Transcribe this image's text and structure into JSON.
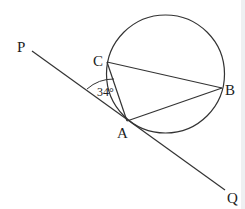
{
  "diagram": {
    "points": {
      "P": {
        "label": "P",
        "x": 32,
        "y": 51
      },
      "C": {
        "label": "C",
        "x": 107,
        "y": 62
      },
      "B": {
        "label": "B",
        "x": 222,
        "y": 88
      },
      "A": {
        "label": "A",
        "x": 127,
        "y": 121
      },
      "Q": {
        "label": "Q",
        "x": 225,
        "y": 190
      }
    },
    "circle": {
      "cx": 165.5,
      "cy": 74,
      "r": 59
    },
    "angle_label": "34°",
    "segments": [
      "PQ (tangent at A)",
      "CB",
      "BA",
      "AC"
    ]
  }
}
